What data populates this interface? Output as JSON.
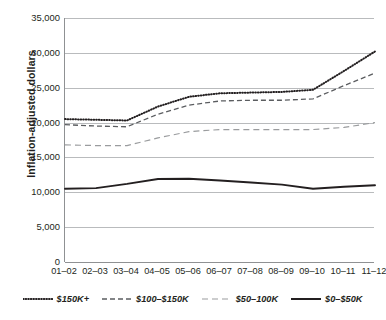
{
  "chart_data": {
    "type": "line",
    "title": "",
    "xlabel": "",
    "ylabel": "Inflation-adjusted dollars",
    "grid": true,
    "legend_position": "bottom",
    "ylim": [
      0,
      35000
    ],
    "ytick_step": 5000,
    "categories": [
      "01–02",
      "02–03",
      "03–04",
      "04–05",
      "05–06",
      "06–07",
      "07–08",
      "08–09",
      "09–10",
      "10–11",
      "11–12"
    ],
    "ytick_labels": [
      "0",
      "5,000",
      "10,000",
      "15,000",
      "20,000",
      "25,000",
      "30,000",
      "35,000"
    ],
    "ytick_values": [
      0,
      5000,
      10000,
      15000,
      20000,
      25000,
      30000,
      35000
    ],
    "series": [
      {
        "name": "$150K+",
        "style": "dotted",
        "color": "#231f20",
        "values": [
          20500,
          20400,
          20300,
          22300,
          23700,
          24200,
          24300,
          24400,
          24700,
          27400,
          30200
        ]
      },
      {
        "name": "$100–$150K",
        "style": "dashed",
        "color": "#5b5d60",
        "values": [
          19700,
          19500,
          19400,
          21200,
          22500,
          23100,
          23200,
          23200,
          23400,
          25300,
          27100
        ]
      },
      {
        "name": "$50–100K",
        "style": "dashed-light",
        "color": "#9a9c9e",
        "values": [
          16800,
          16700,
          16700,
          17800,
          18700,
          19000,
          19000,
          19000,
          19000,
          19300,
          20000
        ]
      },
      {
        "name": "$0–$50K",
        "style": "solid",
        "color": "#231f20",
        "values": [
          10500,
          10600,
          11200,
          11900,
          11950,
          11700,
          11400,
          11100,
          10500,
          10800,
          11000
        ]
      }
    ]
  },
  "legend": {
    "items": [
      {
        "label": "$150K+",
        "style": "dotted",
        "color": "#231f20"
      },
      {
        "label": "$100–$150K",
        "style": "dashed",
        "color": "#5b5d60"
      },
      {
        "label": "$50–100K",
        "style": "dashed-light",
        "color": "#9a9c9e"
      },
      {
        "label": "$0–$50K",
        "style": "solid",
        "color": "#231f20"
      }
    ]
  }
}
